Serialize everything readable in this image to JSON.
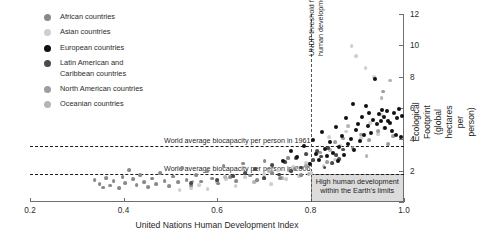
{
  "colors": {
    "african": "#8a8a8a",
    "asian": "#cfcfcf",
    "european": "#111111",
    "latin": "#4a4a4a",
    "north_american": "#9e9e9e",
    "oceanian": "#b5b5b5",
    "axis": "#6f6f6f",
    "box_fill": "#dcdcdc",
    "box_stroke": "#9a9a9a"
  },
  "legend": {
    "items": [
      {
        "label": "African countries",
        "key": "african",
        "color": "#8a8a8a"
      },
      {
        "label": "Asian countries",
        "key": "asian",
        "color": "#cfcfcf"
      },
      {
        "label": "European countries",
        "key": "european",
        "color": "#111111"
      },
      {
        "label": "Latin American and\nCaribbean countries",
        "key": "latin",
        "color": "#4a4a4a"
      },
      {
        "label": "North American countries",
        "key": "north_american",
        "color": "#9e9e9e"
      },
      {
        "label": "Oceanian countries",
        "key": "oceanian",
        "color": "#b5b5b5"
      }
    ]
  },
  "annotations": {
    "biocapacity_1961": "World average biocapacity per person in 1961",
    "biocapacity_2006": "World average biocapacity per person in 2006",
    "undp_threshold": "UNDP threshold for high\nhuman development",
    "sustainable_box": "High human development\nwithin the Earth's limits"
  },
  "chart_data": {
    "type": "scatter",
    "title": "",
    "xlabel": "United Nations Human Development Index",
    "ylabel": "Ecological Footprint\n(global hectares per person)",
    "xlim": [
      0.2,
      1.0
    ],
    "ylim": [
      0,
      12
    ],
    "xticks": [
      0.2,
      0.4,
      0.6,
      0.8,
      1.0
    ],
    "xticklabels": [
      "0.2",
      "0.4",
      "0.6",
      "0.8",
      "1.0"
    ],
    "yticks": [
      0,
      2,
      4,
      6,
      8,
      10,
      12
    ],
    "yticklabels": [
      "0",
      "2",
      "4",
      "6",
      "8",
      "10",
      "12"
    ],
    "yaxis_position": "right",
    "grid": false,
    "legend_position": "upper-left",
    "reference_lines": {
      "horizontal": [
        {
          "label": "World average biocapacity per person in 1961",
          "value": 3.6
        },
        {
          "label": "World average biocapacity per person in 2006",
          "value": 1.8
        }
      ],
      "vertical": [
        {
          "label": "UNDP threshold for high human development",
          "value": 0.8
        }
      ]
    },
    "shaded_region": {
      "label": "High human development within the Earth's limits",
      "x_range": [
        0.8,
        1.0
      ],
      "y_range": [
        0,
        1.8
      ]
    },
    "series": [
      {
        "name": "African countries",
        "color": "#8a8a8a",
        "points": [
          [
            0.338,
            1.4
          ],
          [
            0.349,
            1.12
          ],
          [
            0.356,
            0.92
          ],
          [
            0.362,
            1.55
          ],
          [
            0.371,
            1.05
          ],
          [
            0.379,
            1.32
          ],
          [
            0.39,
            0.88
          ],
          [
            0.398,
            1.6
          ],
          [
            0.404,
            1.2
          ],
          [
            0.412,
            2.05
          ],
          [
            0.42,
            1.45
          ],
          [
            0.428,
            1.08
          ],
          [
            0.436,
            1.7
          ],
          [
            0.444,
            1.25
          ],
          [
            0.452,
            0.95
          ],
          [
            0.461,
            1.5
          ],
          [
            0.47,
            1.15
          ],
          [
            0.479,
            1.85
          ],
          [
            0.488,
            1.35
          ],
          [
            0.497,
            1.0
          ],
          [
            0.506,
            1.62
          ],
          [
            0.516,
            1.28
          ],
          [
            0.526,
            2.15
          ],
          [
            0.535,
            1.42
          ],
          [
            0.545,
            1.05
          ],
          [
            0.556,
            1.72
          ],
          [
            0.566,
            1.3
          ],
          [
            0.578,
            1.95
          ],
          [
            0.59,
            1.5
          ],
          [
            0.602,
            1.18
          ],
          [
            0.614,
            2.3
          ],
          [
            0.628,
            1.58
          ],
          [
            0.641,
            1.35
          ],
          [
            0.655,
            2.45
          ],
          [
            0.67,
            1.68
          ],
          [
            0.686,
            1.4
          ],
          [
            0.702,
            2.6
          ],
          [
            0.718,
            1.82
          ],
          [
            0.735,
            1.55
          ],
          [
            0.752,
            2.8
          ],
          [
            0.766,
            2.1
          ],
          [
            0.78,
            1.7
          ]
        ]
      },
      {
        "name": "Asian countries",
        "color": "#cfcfcf",
        "points": [
          [
            0.52,
            0.75
          ],
          [
            0.545,
            0.9
          ],
          [
            0.562,
            1.1
          ],
          [
            0.58,
            0.82
          ],
          [
            0.6,
            1.25
          ],
          [
            0.62,
            1.45
          ],
          [
            0.64,
            1.0
          ],
          [
            0.66,
            1.6
          ],
          [
            0.682,
            1.3
          ],
          [
            0.7,
            1.8
          ],
          [
            0.715,
            1.15
          ],
          [
            0.73,
            2.0
          ],
          [
            0.748,
            1.45
          ],
          [
            0.762,
            2.25
          ],
          [
            0.776,
            1.65
          ],
          [
            0.79,
            2.5
          ],
          [
            0.802,
            1.85
          ],
          [
            0.815,
            3.1
          ],
          [
            0.828,
            2.3
          ],
          [
            0.84,
            4.15
          ],
          [
            0.852,
            2.7
          ],
          [
            0.864,
            3.6
          ],
          [
            0.876,
            4.5
          ],
          [
            0.888,
            9.95
          ],
          [
            0.898,
            9.3
          ],
          [
            0.908,
            4.1
          ],
          [
            0.918,
            8.55
          ],
          [
            0.928,
            5.05
          ],
          [
            0.936,
            7.95
          ],
          [
            0.944,
            4.35
          ],
          [
            0.952,
            5.55
          ],
          [
            0.958,
            4.7
          ]
        ]
      },
      {
        "name": "European countries",
        "color": "#111111",
        "points": [
          [
            0.742,
            2.6
          ],
          [
            0.758,
            3.25
          ],
          [
            0.772,
            2.85
          ],
          [
            0.786,
            3.55
          ],
          [
            0.798,
            2.4
          ],
          [
            0.806,
            3.95
          ],
          [
            0.812,
            3.05
          ],
          [
            0.818,
            2.7
          ],
          [
            0.824,
            4.45
          ],
          [
            0.83,
            3.4
          ],
          [
            0.836,
            2.95
          ],
          [
            0.842,
            3.8
          ],
          [
            0.848,
            3.15
          ],
          [
            0.854,
            4.8
          ],
          [
            0.858,
            2.6
          ],
          [
            0.862,
            3.5
          ],
          [
            0.868,
            4.2
          ],
          [
            0.872,
            3.0
          ],
          [
            0.876,
            5.35
          ],
          [
            0.88,
            3.7
          ],
          [
            0.886,
            4.05
          ],
          [
            0.89,
            6.25
          ],
          [
            0.894,
            3.35
          ],
          [
            0.898,
            4.6
          ],
          [
            0.902,
            5.0
          ],
          [
            0.906,
            3.9
          ],
          [
            0.91,
            5.45
          ],
          [
            0.914,
            4.25
          ],
          [
            0.918,
            6.1
          ],
          [
            0.922,
            4.85
          ],
          [
            0.926,
            5.7
          ],
          [
            0.93,
            4.4
          ],
          [
            0.934,
            5.25
          ],
          [
            0.938,
            7.85
          ],
          [
            0.942,
            4.95
          ],
          [
            0.946,
            5.6
          ],
          [
            0.95,
            5.15
          ],
          [
            0.954,
            5.9
          ],
          [
            0.958,
            5.4
          ],
          [
            0.96,
            4.7
          ],
          [
            0.964,
            5.8
          ],
          [
            0.966,
            5.2
          ],
          [
            0.97,
            5.05
          ],
          [
            0.974,
            4.55
          ],
          [
            0.978,
            5.65
          ],
          [
            0.982,
            4.3
          ],
          [
            0.986,
            5.35
          ],
          [
            0.99,
            5.95
          ],
          [
            0.994,
            4.15
          ],
          [
            0.996,
            5.5
          ]
        ]
      },
      {
        "name": "Latin American and Caribbean countries",
        "color": "#4a4a4a",
        "points": [
          [
            0.545,
            1.2
          ],
          [
            0.6,
            1.4
          ],
          [
            0.635,
            1.65
          ],
          [
            0.66,
            1.85
          ],
          [
            0.682,
            2.1
          ],
          [
            0.7,
            1.55
          ],
          [
            0.718,
            2.35
          ],
          [
            0.732,
            1.75
          ],
          [
            0.746,
            2.55
          ],
          [
            0.758,
            1.95
          ],
          [
            0.77,
            2.8
          ],
          [
            0.78,
            2.2
          ],
          [
            0.79,
            3.05
          ],
          [
            0.798,
            2.45
          ],
          [
            0.806,
            2.65
          ],
          [
            0.814,
            3.25
          ],
          [
            0.822,
            2.9
          ],
          [
            0.83,
            2.2
          ],
          [
            0.838,
            3.45
          ],
          [
            0.846,
            2.5
          ],
          [
            0.854,
            3.0
          ],
          [
            0.862,
            2.75
          ],
          [
            0.87,
            3.35
          ]
        ]
      },
      {
        "name": "North American countries",
        "color": "#9e9e9e",
        "points": [
          [
            0.7,
            1.5
          ],
          [
            0.754,
            2.05
          ],
          [
            0.79,
            2.3
          ],
          [
            0.82,
            3.15
          ],
          [
            0.836,
            2.55
          ],
          [
            0.852,
            3.8
          ],
          [
            0.87,
            4.05
          ],
          [
            0.89,
            3.45
          ],
          [
            0.908,
            4.3
          ],
          [
            0.926,
            3.95
          ],
          [
            0.944,
            4.55
          ],
          [
            0.956,
            7.05
          ],
          [
            0.966,
            3.7
          ],
          [
            0.976,
            4.2
          ]
        ]
      },
      {
        "name": "Oceanian countries",
        "color": "#b5b5b5",
        "points": [
          [
            0.548,
            1.3
          ],
          [
            0.618,
            1.6
          ],
          [
            0.68,
            1.25
          ],
          [
            0.712,
            1.95
          ],
          [
            0.74,
            1.55
          ],
          [
            0.768,
            2.2
          ],
          [
            0.796,
            1.8
          ],
          [
            0.842,
            3.3
          ],
          [
            0.88,
            4.85
          ],
          [
            0.92,
            2.95
          ],
          [
            0.952,
            6.65
          ],
          [
            0.97,
            7.75
          ]
        ]
      }
    ]
  }
}
